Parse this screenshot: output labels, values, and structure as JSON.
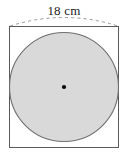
{
  "figure": {
    "dimension_label": "18 cm",
    "measurement": {
      "value": 18,
      "unit": "cm",
      "applies_to": "square side length and circle diameter"
    },
    "colors": {
      "background": "#ffffff",
      "square_stroke": "#5a5a5a",
      "square_fill": "#ffffff",
      "circle_fill": "#d9d9d9",
      "circle_stroke": "#6e6e6e",
      "center_dot": "#000000",
      "leader_line": "#9a9a9a",
      "label_text": "#1c1c1c"
    },
    "shapes": {
      "square": {
        "name": "square",
        "x": 9.5,
        "y": 26.5,
        "width": 109,
        "height": 121,
        "side_label": "18 cm"
      },
      "circle": {
        "name": "inscribed-circle",
        "cx": 64,
        "cy": 87,
        "r": 54.5,
        "diameter_label": "18 cm"
      },
      "center_dot": {
        "name": "circle-center-point",
        "cx": 64,
        "cy": 87,
        "r": 2.1
      },
      "leader_arc": {
        "name": "dimension-leader-arc",
        "from_x": 10,
        "from_y": 26,
        "to_x": 118,
        "to_y": 26,
        "apex_y": 9,
        "style": "dashed"
      }
    }
  }
}
